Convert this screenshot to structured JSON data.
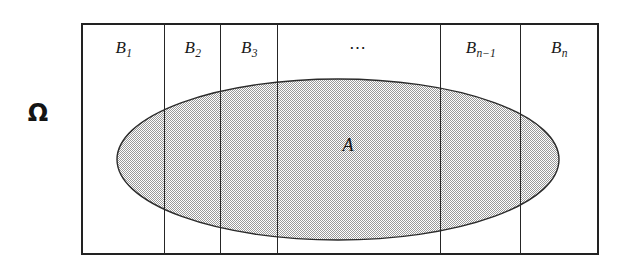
{
  "figure": {
    "type": "set-partition-venn-diagram",
    "sample_space": {
      "label": "Ω",
      "name": "omega"
    },
    "event": {
      "label": "A",
      "fill_color": "#c9c9c9",
      "stroke_color": "#2b2b2b"
    },
    "partition": {
      "cells": [
        {
          "base": "B",
          "sub": "1",
          "label": "B1"
        },
        {
          "base": "B",
          "sub": "2",
          "label": "B2"
        },
        {
          "base": "B",
          "sub": "3",
          "label": "B3"
        },
        {
          "base": "⋯",
          "sub": "",
          "label": "⋯"
        },
        {
          "base": "B",
          "sub": "n−1",
          "label": "Bn-1"
        },
        {
          "base": "B",
          "sub": "n",
          "label": "Bn"
        }
      ]
    },
    "colors": {
      "border": "#222222",
      "divider": "#262626",
      "background": "#ffffff",
      "text": "#1a1a1a"
    }
  }
}
